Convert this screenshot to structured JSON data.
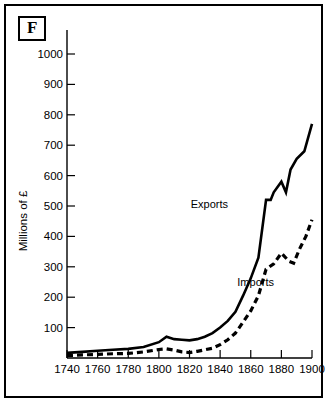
{
  "figure": {
    "panel_letter": "F"
  },
  "chart_data": {
    "type": "line",
    "title": "",
    "xlabel": "",
    "ylabel": "Millions of £",
    "xlim": [
      1740,
      1900
    ],
    "ylim": [
      0,
      1050
    ],
    "grid": false,
    "legend_position": "inline-annotation",
    "xticks": [
      1740,
      1760,
      1780,
      1800,
      1820,
      1840,
      1860,
      1880,
      1900
    ],
    "xtick_labels": [
      "1740",
      "1760",
      "1780",
      "1800",
      "1820",
      "1840",
      "1860",
      "1880",
      "1900"
    ],
    "yticks": [
      100,
      200,
      300,
      400,
      500,
      600,
      700,
      800,
      900,
      1000
    ],
    "ytick_labels": [
      "100",
      "200",
      "300",
      "400",
      "500",
      "600",
      "700",
      "800",
      "900",
      "1000"
    ],
    "series": [
      {
        "name": "Exports",
        "style": "solid",
        "color": "#000000",
        "label_text": "Exports",
        "x": [
          1740,
          1750,
          1760,
          1770,
          1780,
          1790,
          1800,
          1805,
          1810,
          1815,
          1820,
          1825,
          1830,
          1835,
          1840,
          1845,
          1850,
          1855,
          1860,
          1865,
          1870,
          1873,
          1875,
          1880,
          1883,
          1886,
          1890,
          1895,
          1900
        ],
        "values": [
          17,
          20,
          24,
          27,
          30,
          36,
          52,
          70,
          62,
          60,
          58,
          62,
          70,
          82,
          100,
          122,
          152,
          205,
          262,
          330,
          520,
          520,
          545,
          580,
          545,
          620,
          655,
          680,
          770
        ]
      },
      {
        "name": "Imports",
        "style": "dashed",
        "color": "#000000",
        "label_text": "Imports",
        "x": [
          1740,
          1750,
          1760,
          1770,
          1780,
          1790,
          1800,
          1805,
          1810,
          1815,
          1820,
          1825,
          1830,
          1835,
          1840,
          1845,
          1850,
          1855,
          1860,
          1865,
          1870,
          1875,
          1880,
          1885,
          1888,
          1892,
          1896,
          1900
        ],
        "values": [
          8,
          10,
          12,
          14,
          15,
          20,
          28,
          30,
          26,
          20,
          18,
          22,
          27,
          32,
          44,
          60,
          82,
          118,
          155,
          205,
          292,
          310,
          345,
          318,
          312,
          360,
          400,
          455
        ]
      }
    ],
    "annotations": [
      {
        "text": "Exports",
        "x_px": 222,
        "y_px": 202
      },
      {
        "text": "Imports",
        "x_px": 268,
        "y_px": 280
      }
    ]
  }
}
